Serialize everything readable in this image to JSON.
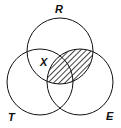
{
  "diagram": {
    "type": "venn",
    "sets": [
      {
        "label": "R",
        "cx": 60,
        "cy": 51,
        "r": 33
      },
      {
        "label": "T",
        "cx": 40,
        "cy": 82,
        "r": 33
      },
      {
        "label": "E",
        "cx": 80,
        "cy": 82,
        "r": 33
      }
    ],
    "marker": {
      "label": "X",
      "region": "R∩T only"
    },
    "shaded_region": "R∩E",
    "colors": {
      "stroke": "#111111",
      "hatch": "#111111",
      "background": "#ffffff"
    }
  }
}
